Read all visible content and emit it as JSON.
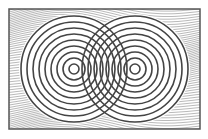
{
  "figure": {
    "frame": {
      "x": 9,
      "y": 9,
      "width": 191,
      "height": 120,
      "stroke": "#555555"
    },
    "background_hatch": {
      "color": "#8a8a8a",
      "spacing": 2.2
    },
    "circles": {
      "stroke": "#444444",
      "stroke_width": 1.6,
      "spacing": 6,
      "count": 9,
      "centers": [
        {
          "name": "left",
          "cx": 74,
          "cy": 69
        },
        {
          "name": "right",
          "cx": 135,
          "cy": 69
        }
      ],
      "inner_radius": 5
    }
  }
}
